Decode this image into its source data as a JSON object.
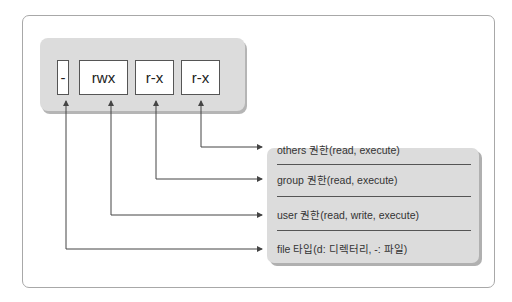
{
  "diagram": {
    "permission_string": [
      {
        "label": "-",
        "meaning_index": 3
      },
      {
        "label": "rwx",
        "meaning_index": 2
      },
      {
        "label": "r-x",
        "meaning_index": 1
      },
      {
        "label": "r-x",
        "meaning_index": 0
      }
    ],
    "legend": [
      {
        "text": "others 권한(read, execute)"
      },
      {
        "text": "group 권한(read, execute)"
      },
      {
        "text": "user 권한(read, write, execute)"
      },
      {
        "text": "file 타입(d: 디렉터리, -: 파일)"
      }
    ],
    "colors": {
      "panel": "#dcdcdc",
      "box_border": "#555555",
      "arrow": "#444444",
      "frame": "#a8a8a8"
    }
  }
}
